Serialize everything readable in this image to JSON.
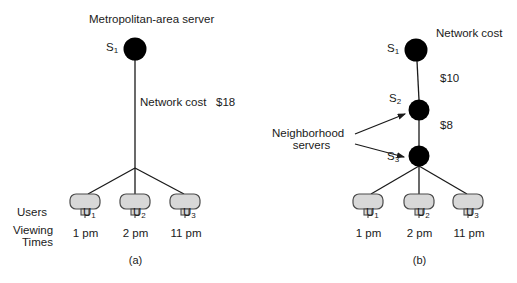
{
  "figure": {
    "type": "network-diagram",
    "caption_a": "(a)",
    "caption_b": "(b)"
  },
  "panel_a": {
    "title": "Metropolitan-area server",
    "server": {
      "label": "S",
      "sub": "1",
      "kind": "metropolitan-area-server",
      "color": "#000000"
    },
    "link": {
      "cost_text": "Network cost   $18",
      "cost_label": "Network cost",
      "cost_value": "$18"
    },
    "users_label": "Users",
    "viewing_label_line1": "Viewing",
    "viewing_label_line2": "Times",
    "users": [
      {
        "label": "U",
        "sub": "1",
        "time": "1 pm"
      },
      {
        "label": "U",
        "sub": "2",
        "time": "2 pm"
      },
      {
        "label": "U",
        "sub": "3",
        "time": "11 pm"
      }
    ]
  },
  "panel_b": {
    "network_cost_label": "Network cost",
    "neighborhood_label_line1": "Neighborhood",
    "neighborhood_label_line2": "servers",
    "servers": [
      {
        "label": "S",
        "sub": "1",
        "kind": "metropolitan-area-server"
      },
      {
        "label": "S",
        "sub": "2",
        "kind": "neighborhood-server"
      },
      {
        "label": "S",
        "sub": "3",
        "kind": "neighborhood-server"
      }
    ],
    "costs": [
      {
        "value": "$10",
        "from": "S1",
        "to": "S2"
      },
      {
        "value": "$8",
        "from": "S2",
        "to": "S3"
      }
    ],
    "users": [
      {
        "label": "U",
        "sub": "1",
        "time": "1 pm"
      },
      {
        "label": "U",
        "sub": "2",
        "time": "2 pm"
      },
      {
        "label": "U",
        "sub": "3",
        "time": "11 pm"
      }
    ]
  },
  "colors": {
    "node_fill": "#000000",
    "monitor_fill": "#d8d8d8",
    "monitor_stroke": "#4a4a4a",
    "line": "#1a1a1a",
    "text": "#1a1a1a",
    "background": "#ffffff"
  }
}
